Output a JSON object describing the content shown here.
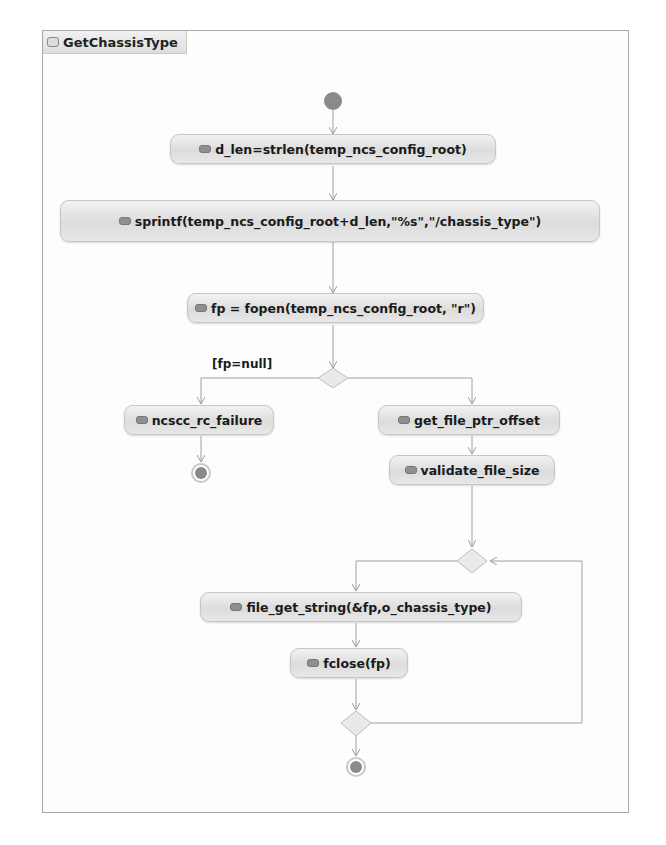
{
  "diagram": {
    "title": "GetChassisType",
    "type": "activity",
    "nodes": {
      "init": "initial",
      "n1": "d_len=strlen(temp_ncs_config_root)",
      "n2": "sprintf(temp_ncs_config_root+d_len,\"%s\",\"/chassis_type\")",
      "n3": "fp = fopen(temp_ncs_config_root, \"r\")",
      "n4": "ncscc_rc_failure",
      "n5": "get_file_ptr_offset",
      "n6": "validate_file_size",
      "n7": "file_get_string(&fp,o_chassis_type)",
      "n8": "fclose(fp)"
    },
    "guards": {
      "fp_null": "[fp=null]"
    },
    "edges": [
      [
        "init",
        "n1"
      ],
      [
        "n1",
        "n2"
      ],
      [
        "n2",
        "n3"
      ],
      [
        "n3",
        "decision1"
      ],
      [
        "decision1",
        "n4",
        "[fp=null]"
      ],
      [
        "decision1",
        "n5"
      ],
      [
        "n4",
        "final1"
      ],
      [
        "n5",
        "n6"
      ],
      [
        "n6",
        "merge1"
      ],
      [
        "merge1",
        "n7"
      ],
      [
        "n7",
        "n8"
      ],
      [
        "n8",
        "decision2"
      ],
      [
        "decision2",
        "merge1"
      ],
      [
        "decision2",
        "final2"
      ]
    ],
    "colors": {
      "node_fill": "#e2e2e2",
      "node_border": "#c6c6c6",
      "edge": "#9a9a9a",
      "initial": "#8a8a8a"
    }
  }
}
